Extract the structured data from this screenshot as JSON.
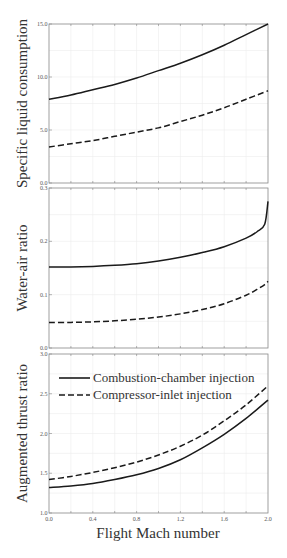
{
  "chart_data": [
    {
      "type": "line",
      "title": "",
      "xlabel": "",
      "ylabel": "Specific liquid consumption",
      "xlim": [
        0.0,
        2.0
      ],
      "ylim": [
        0.0,
        15.0
      ],
      "yticks": [
        "0.0",
        "5.0",
        "10.0",
        "15.0"
      ],
      "yticks_values": [
        0,
        5,
        10,
        15
      ],
      "grid": true,
      "x": [
        0.0,
        0.2,
        0.4,
        0.6,
        0.8,
        1.0,
        1.2,
        1.4,
        1.6,
        1.8,
        2.0
      ],
      "series": [
        {
          "name": "Combustion-chamber injection",
          "style": "solid",
          "values": [
            7.9,
            8.3,
            8.8,
            9.3,
            9.9,
            10.6,
            11.3,
            12.1,
            13.0,
            14.0,
            15.0
          ]
        },
        {
          "name": "Compressor-inlet injection",
          "style": "dashed",
          "values": [
            3.4,
            3.7,
            4.0,
            4.4,
            4.8,
            5.2,
            5.8,
            6.4,
            7.1,
            7.9,
            8.7
          ]
        }
      ]
    },
    {
      "type": "line",
      "title": "",
      "xlabel": "",
      "ylabel": "Water-air ratio",
      "xlim": [
        0.0,
        2.0
      ],
      "ylim": [
        0.0,
        0.3
      ],
      "yticks": [
        "0.0",
        "0.1",
        "0.2",
        "0.3"
      ],
      "yticks_values": [
        0,
        0.1,
        0.2,
        0.3
      ],
      "grid": true,
      "x": [
        0.0,
        0.2,
        0.4,
        0.6,
        0.8,
        1.0,
        1.2,
        1.4,
        1.6,
        1.8,
        1.9,
        1.97,
        2.0
      ],
      "series": [
        {
          "name": "Combustion-chamber injection",
          "style": "solid",
          "values": [
            0.152,
            0.152,
            0.153,
            0.155,
            0.158,
            0.163,
            0.17,
            0.179,
            0.19,
            0.206,
            0.218,
            0.232,
            0.275
          ]
        },
        {
          "name": "Compressor-inlet injection",
          "style": "dashed",
          "values": [
            0.048,
            0.048,
            0.049,
            0.051,
            0.054,
            0.058,
            0.064,
            0.072,
            0.083,
            0.099,
            0.11,
            0.119,
            0.125
          ]
        }
      ]
    },
    {
      "type": "line",
      "title": "",
      "xlabel": "Flight Mach number",
      "ylabel": "Augmented thrust ratio",
      "xlim": [
        0.0,
        2.0
      ],
      "ylim": [
        1.0,
        3.0
      ],
      "xticks": [
        "0.0",
        "0.4",
        "0.8",
        "1.2",
        "1.6",
        "2.0"
      ],
      "xticks_values": [
        0.0,
        0.4,
        0.8,
        1.2,
        1.6,
        2.0
      ],
      "yticks": [
        "1.0",
        "1.5",
        "2.0",
        "2.5",
        "3.0"
      ],
      "yticks_values": [
        1.0,
        1.5,
        2.0,
        2.5,
        3.0
      ],
      "grid": true,
      "legend": "top-left",
      "x": [
        0.0,
        0.2,
        0.4,
        0.6,
        0.8,
        1.0,
        1.2,
        1.4,
        1.6,
        1.8,
        2.0
      ],
      "series": [
        {
          "name": "Combustion-chamber injection",
          "style": "solid",
          "values": [
            1.32,
            1.34,
            1.37,
            1.42,
            1.48,
            1.56,
            1.67,
            1.82,
            1.99,
            2.19,
            2.42
          ]
        },
        {
          "name": "Compressor-inlet injection",
          "style": "dashed",
          "values": [
            1.42,
            1.46,
            1.51,
            1.57,
            1.64,
            1.73,
            1.84,
            1.98,
            2.16,
            2.36,
            2.6
          ]
        }
      ]
    }
  ],
  "legend": {
    "entries": [
      "Combustion-chamber injection",
      "Compressor-inlet injection"
    ]
  },
  "colors": {
    "line": "#1a1a1a",
    "axis": "#888888",
    "grid": "#ececec"
  }
}
